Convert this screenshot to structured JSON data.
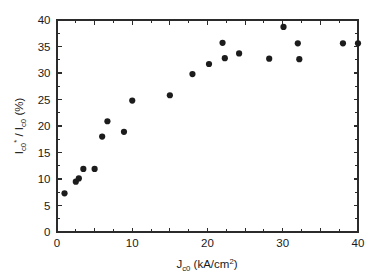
{
  "chart_data": {
    "type": "scatter",
    "title": "",
    "xlabel": "J_c0 (kA/cm^2)",
    "ylabel": "I_c0* / I_c0 (%)",
    "xlabel_parts": {
      "base": "J",
      "subscript": "c0",
      "unit_prefix": " (kA/cm",
      "unit_superscript": "2",
      "unit_suffix": ")"
    },
    "ylabel_parts": {
      "base1": "I",
      "subscript1": "c0",
      "superscript1": "*",
      "separator": " / I",
      "subscript2": "c0",
      "unit": " (%)"
    },
    "xlim": [
      0,
      40
    ],
    "ylim": [
      0,
      40
    ],
    "xticks": [
      0,
      5,
      10,
      15,
      20,
      25,
      30,
      35,
      40
    ],
    "xticklabels": [
      "0",
      "",
      "10",
      "",
      "20",
      "",
      "30",
      "",
      "40"
    ],
    "yticks": [
      0,
      5,
      10,
      15,
      20,
      25,
      30,
      35,
      40
    ],
    "yticklabels": [
      "0",
      "5",
      "10",
      "15",
      "20",
      "25",
      "30",
      "35",
      "40"
    ],
    "x_minor_step": 2.5,
    "y_minor_step": 2.5,
    "grid": false,
    "legend": null,
    "marker_style": "filled-circle",
    "marker_color": "#1c1c1c",
    "marker_size_px": 5.0,
    "x": [
      1.0,
      2.5,
      2.9,
      3.5,
      5.0,
      6.0,
      6.7,
      8.9,
      10.0,
      15.0,
      18.0,
      20.2,
      22.0,
      22.3,
      24.2,
      28.2,
      30.1,
      32.0,
      32.2,
      38.0,
      40.0
    ],
    "y": [
      7.3,
      9.5,
      10.1,
      11.9,
      11.9,
      18.0,
      20.9,
      18.9,
      24.8,
      25.8,
      29.8,
      31.7,
      35.7,
      32.8,
      33.7,
      32.7,
      38.7,
      35.6,
      32.6,
      35.6,
      35.6
    ],
    "points": [
      {
        "x": 1.0,
        "y": 7.3
      },
      {
        "x": 2.5,
        "y": 9.5
      },
      {
        "x": 2.9,
        "y": 10.1
      },
      {
        "x": 3.5,
        "y": 11.9
      },
      {
        "x": 5.0,
        "y": 11.9
      },
      {
        "x": 6.0,
        "y": 18.0
      },
      {
        "x": 6.7,
        "y": 20.9
      },
      {
        "x": 8.9,
        "y": 18.9
      },
      {
        "x": 10.0,
        "y": 24.8
      },
      {
        "x": 15.0,
        "y": 25.8
      },
      {
        "x": 18.0,
        "y": 29.8
      },
      {
        "x": 20.2,
        "y": 31.7
      },
      {
        "x": 22.0,
        "y": 35.7
      },
      {
        "x": 22.3,
        "y": 32.8
      },
      {
        "x": 24.2,
        "y": 33.7
      },
      {
        "x": 28.2,
        "y": 32.7
      },
      {
        "x": 30.1,
        "y": 38.7
      },
      {
        "x": 32.0,
        "y": 35.6
      },
      {
        "x": 32.2,
        "y": 32.6
      },
      {
        "x": 38.0,
        "y": 35.6
      },
      {
        "x": 40.0,
        "y": 35.6
      }
    ]
  },
  "figure": {
    "background_color": "#ffffff",
    "axis_color": "#2b2b2b"
  }
}
